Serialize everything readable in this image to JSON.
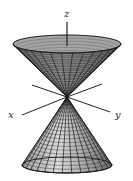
{
  "figure": {
    "axes": {
      "x_label": "x",
      "y_label": "y",
      "z_label": "z"
    },
    "colors": {
      "surface_fill": "#c8c8c8",
      "mesh_line": "#1a1a1a",
      "axis": "#222222",
      "background": "#ffffff"
    },
    "geometry": {
      "apex": [
        67,
        97
      ],
      "top_rim": {
        "cx": 67,
        "cy": 44,
        "rx": 54,
        "ry": 9
      },
      "bottom_rim": {
        "cx": 67,
        "cy": 165,
        "rx": 45,
        "ry": 8
      },
      "meridians": 16,
      "parallels": 20
    }
  }
}
